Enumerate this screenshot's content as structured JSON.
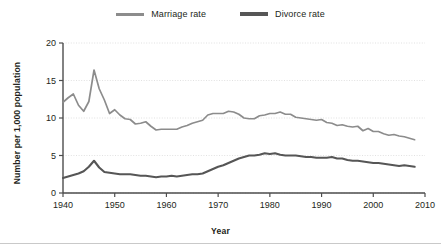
{
  "chart_data": {
    "type": "line",
    "title": "",
    "xlabel": "Year",
    "ylabel": "Number per 1,000 population",
    "xlim": [
      1940,
      2010
    ],
    "ylim": [
      0,
      20
    ],
    "xticks": [
      1940,
      1950,
      1960,
      1970,
      1980,
      1990,
      2000,
      2010
    ],
    "yticks": [
      0,
      5,
      10,
      15,
      20
    ],
    "grid": true,
    "grid_style": "dotted-horizontal",
    "legend_position": "top-center",
    "x": [
      1940,
      1941,
      1942,
      1943,
      1944,
      1945,
      1946,
      1947,
      1948,
      1949,
      1950,
      1951,
      1952,
      1953,
      1954,
      1955,
      1956,
      1957,
      1958,
      1959,
      1960,
      1961,
      1962,
      1963,
      1964,
      1965,
      1966,
      1967,
      1968,
      1969,
      1970,
      1971,
      1972,
      1973,
      1974,
      1975,
      1976,
      1977,
      1978,
      1979,
      1980,
      1981,
      1982,
      1983,
      1984,
      1985,
      1986,
      1987,
      1988,
      1989,
      1990,
      1991,
      1992,
      1993,
      1994,
      1995,
      1996,
      1997,
      1998,
      1999,
      2000,
      2001,
      2002,
      2003,
      2004,
      2005,
      2006,
      2007,
      2008
    ],
    "series": [
      {
        "name": "Marriage rate",
        "color": "#8c8c8c",
        "values": [
          12.1,
          12.7,
          13.2,
          11.7,
          10.9,
          12.2,
          16.4,
          13.9,
          12.4,
          10.6,
          11.1,
          10.4,
          9.9,
          9.8,
          9.2,
          9.3,
          9.5,
          8.9,
          8.4,
          8.5,
          8.5,
          8.5,
          8.5,
          8.8,
          9.0,
          9.3,
          9.5,
          9.7,
          10.4,
          10.6,
          10.6,
          10.6,
          10.9,
          10.8,
          10.5,
          10.0,
          9.9,
          9.9,
          10.3,
          10.4,
          10.6,
          10.6,
          10.6,
          10.5,
          10.5,
          10.1,
          10.0,
          9.9,
          9.8,
          9.7,
          9.8,
          9.4,
          9.3,
          9.0,
          9.1,
          8.9,
          8.8,
          8.9,
          8.3,
          8.6,
          8.2,
          8.2,
          7.9,
          7.7,
          7.8,
          7.6,
          7.5,
          7.3,
          7.1
        ],
        "note_values_plot": [
          12.1,
          12.7,
          13.2,
          11.7,
          10.9,
          12.2,
          16.4,
          13.9,
          12.4,
          10.6,
          11.1,
          10.4,
          9.9,
          9.8,
          9.2,
          9.3,
          9.5,
          8.9,
          8.4,
          8.5,
          8.5,
          8.5,
          8.5,
          8.8,
          9.0,
          9.3,
          9.5,
          9.7,
          10.4,
          10.6,
          10.6,
          10.6,
          10.9,
          10.8,
          10.5,
          10.0,
          9.9,
          9.9,
          10.3,
          10.4,
          10.6,
          10.6,
          10.8,
          10.5,
          10.5,
          10.1,
          10.0,
          9.9,
          9.8,
          9.7,
          9.8,
          9.4,
          9.3,
          9.0,
          9.1,
          8.9,
          8.8,
          8.9,
          8.3,
          8.6,
          8.2,
          8.2,
          7.9,
          7.7,
          7.8,
          7.6,
          7.5,
          7.3,
          7.1
        ]
      },
      {
        "name": "Divorce rate",
        "color": "#565656",
        "values": [
          2.0,
          2.2,
          2.4,
          2.6,
          2.9,
          3.5,
          4.3,
          3.4,
          2.8,
          2.7,
          2.6,
          2.5,
          2.5,
          2.5,
          2.4,
          2.3,
          2.3,
          2.2,
          2.1,
          2.2,
          2.2,
          2.3,
          2.2,
          2.3,
          2.4,
          2.5,
          2.5,
          2.6,
          2.9,
          3.2,
          3.5,
          3.7,
          4.0,
          4.3,
          4.6,
          4.8,
          5.0,
          5.0,
          5.1,
          5.3,
          5.2,
          5.3,
          5.1,
          5.0,
          5.0,
          5.0,
          4.9,
          4.8,
          4.8,
          4.7,
          4.7,
          4.7,
          4.8,
          4.6,
          4.6,
          4.4,
          4.3,
          4.3,
          4.2,
          4.1,
          4.0,
          4.0,
          3.9,
          3.8,
          3.7,
          3.6,
          3.7,
          3.6,
          3.5
        ]
      }
    ]
  },
  "axes": {
    "ytick_labels": [
      "0",
      "5",
      "10",
      "15",
      "20"
    ],
    "xtick_labels": [
      "1940",
      "1950",
      "1960",
      "1970",
      "1980",
      "1990",
      "2000",
      "2010"
    ],
    "ylabel_text": "Number per 1,000 population",
    "xlabel_text": "Year"
  },
  "legend": {
    "items": [
      {
        "label": "Marriage rate",
        "color": "#8c8c8c"
      },
      {
        "label": "Divorce rate",
        "color": "#565656"
      }
    ]
  },
  "colors": {
    "marriage": "#8c8c8c",
    "divorce": "#565656",
    "axis": "#4d4d4d",
    "grid": "#d9d9d9",
    "text": "#231f20",
    "background": "#ffffff"
  }
}
